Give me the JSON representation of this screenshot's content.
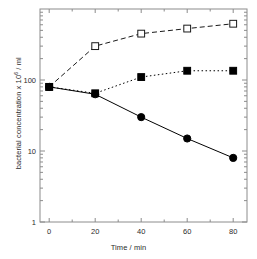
{
  "chart_data": {
    "type": "line",
    "title": "",
    "xlabel": "Time / min",
    "ylabel_prefix": "bacterial concentration x 10",
    "ylabel_exponent": "6",
    "ylabel_suffix": " / ml",
    "ylabel_full": "bacterial concentration x 10⁶ / ml",
    "yscale": "log",
    "ylim": [
      1,
      1000
    ],
    "xlim": [
      -4,
      86
    ],
    "grid": false,
    "legend": "none",
    "xticks": [
      0,
      20,
      40,
      60,
      80
    ],
    "xtick_labels": [
      "0",
      "20",
      "40",
      "60",
      "80"
    ],
    "yticks": [
      1,
      10,
      100
    ],
    "ytick_labels": [
      "1",
      "10",
      "100"
    ],
    "x": [
      0,
      20,
      40,
      60,
      80
    ],
    "series": [
      {
        "name": "open-squares-dashed",
        "marker": "open-square",
        "linestyle": "dashed",
        "color": "#1a1a1a",
        "values": [
          80,
          300,
          450,
          530,
          620
        ]
      },
      {
        "name": "filled-squares-dotted",
        "marker": "filled-square",
        "linestyle": "dotted",
        "color": "#000000",
        "values": [
          80,
          65,
          110,
          135,
          135
        ]
      },
      {
        "name": "filled-circles-solid",
        "marker": "filled-circle",
        "linestyle": "solid",
        "color": "#000000",
        "values": [
          80,
          63,
          30,
          15,
          8
        ]
      }
    ]
  },
  "figure": {
    "background": "#ffffff",
    "axis_color": "#8c8c8c",
    "text_color": "#2b2b2b"
  }
}
